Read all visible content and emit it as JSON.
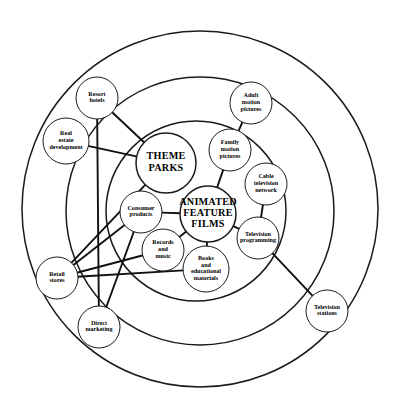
{
  "diagram": {
    "type": "concentric-relationship-map",
    "background": "#ffffff",
    "stroke_color": "#1a1a1a",
    "label_color": "#000000",
    "canvas": {
      "width": 402,
      "height": 417
    },
    "rings": [
      {
        "name": "outer-ring",
        "cx": 200,
        "cy": 209,
        "r": 178,
        "stroke_width": 1.5
      },
      {
        "name": "middle-ring",
        "cx": 200,
        "cy": 211,
        "r": 134,
        "stroke_width": 1.5
      },
      {
        "name": "inner-ring",
        "cx": 196,
        "cy": 211,
        "r": 90,
        "stroke_width": 1.5
      }
    ],
    "core_nodes": [
      {
        "id": "theme-parks",
        "label": "THEME PARKS",
        "lines": [
          "THEME",
          "PARKS"
        ],
        "cx": 166,
        "cy": 163,
        "r": 30
      },
      {
        "id": "animated-feature-films",
        "label": "ANIMATED FEATURE FILMS",
        "lines": [
          "ANIMATED",
          "FEATURE",
          "FILMS"
        ],
        "cx": 208,
        "cy": 214,
        "r": 28
      }
    ],
    "satellite_nodes": [
      {
        "id": "resort-hotels",
        "label": "Resort hotels",
        "lines": [
          "Resort",
          "hotels"
        ],
        "cx": 97,
        "cy": 98,
        "r": 21
      },
      {
        "id": "real-estate-development",
        "label": "Real estate development",
        "lines": [
          "Real",
          "estate",
          "development"
        ],
        "cx": 66,
        "cy": 141,
        "r": 23
      },
      {
        "id": "adult-motion-pictures",
        "label": "Adult motion pictures",
        "lines": [
          "Adult",
          "motion",
          "pictures"
        ],
        "cx": 251,
        "cy": 103,
        "r": 21
      },
      {
        "id": "family-motion-pictures",
        "label": "Family motion pictures",
        "lines": [
          "Family",
          "motion",
          "pictures"
        ],
        "cx": 230,
        "cy": 150,
        "r": 21
      },
      {
        "id": "cable-television-network",
        "label": "Cable television network",
        "lines": [
          "Cable",
          "television",
          "network"
        ],
        "cx": 266,
        "cy": 184,
        "r": 21
      },
      {
        "id": "television-programming",
        "label": "Television programming",
        "lines": [
          "Television",
          "programming"
        ],
        "cx": 258,
        "cy": 238,
        "r": 21
      },
      {
        "id": "television-stations",
        "label": "Television stations",
        "lines": [
          "Television",
          "stations"
        ],
        "cx": 327,
        "cy": 311,
        "r": 21
      },
      {
        "id": "consumer-products",
        "label": "Consumer products",
        "lines": [
          "Consumer",
          "products"
        ],
        "cx": 141,
        "cy": 212,
        "r": 21
      },
      {
        "id": "records-and-music",
        "label": "Records and music",
        "lines": [
          "Records",
          "and",
          "music"
        ],
        "cx": 163,
        "cy": 250,
        "r": 21
      },
      {
        "id": "books-and-educational-materials",
        "label": "Books and educational materials",
        "lines": [
          "Books",
          "and",
          "educational",
          "materials"
        ],
        "cx": 206,
        "cy": 269,
        "r": 23
      },
      {
        "id": "retail-stores",
        "label": "Retail stores",
        "lines": [
          "Retail",
          "stores"
        ],
        "cx": 57,
        "cy": 278,
        "r": 21
      },
      {
        "id": "direct-marketing",
        "label": "Direct marketing",
        "lines": [
          "Direct",
          "marketing"
        ],
        "cx": 99,
        "cy": 327,
        "r": 21
      }
    ],
    "links": [
      {
        "from": "resort-hotels",
        "to": "theme-parks"
      },
      {
        "from": "real-estate-development",
        "to": "theme-parks"
      },
      {
        "from": "resort-hotels",
        "to": "direct-marketing"
      },
      {
        "from": "adult-motion-pictures",
        "to": "family-motion-pictures"
      },
      {
        "from": "family-motion-pictures",
        "to": "animated-feature-films"
      },
      {
        "from": "cable-television-network",
        "to": "television-programming"
      },
      {
        "from": "television-programming",
        "to": "animated-feature-films"
      },
      {
        "from": "television-programming",
        "to": "television-stations"
      },
      {
        "from": "consumer-products",
        "to": "animated-feature-films"
      },
      {
        "from": "records-and-music",
        "to": "animated-feature-films"
      },
      {
        "from": "books-and-educational-materials",
        "to": "animated-feature-films"
      },
      {
        "from": "retail-stores",
        "to": "theme-parks"
      },
      {
        "from": "retail-stores",
        "to": "consumer-products"
      },
      {
        "from": "retail-stores",
        "to": "records-and-music"
      },
      {
        "from": "retail-stores",
        "to": "books-and-educational-materials"
      },
      {
        "from": "consumer-products",
        "to": "direct-marketing"
      }
    ]
  }
}
